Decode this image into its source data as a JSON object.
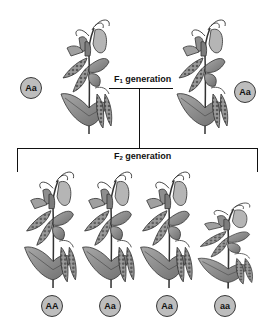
{
  "diagram": {
    "type": "mendelian-inheritance",
    "f1": {
      "label_prefix": "F",
      "label_sub": "1",
      "label_suffix": " generation",
      "plants": [
        {
          "genotype": "Aa",
          "phenotype": "tall"
        },
        {
          "genotype": "Aa",
          "phenotype": "tall"
        }
      ]
    },
    "f2": {
      "label_prefix": "F",
      "label_sub": "2",
      "label_suffix": " generation",
      "plants": [
        {
          "genotype": "AA",
          "phenotype": "tall"
        },
        {
          "genotype": "Aa",
          "phenotype": "tall"
        },
        {
          "genotype": "Aa",
          "phenotype": "tall"
        },
        {
          "genotype": "aa",
          "phenotype": "short"
        }
      ]
    },
    "colors": {
      "circle_fill": "#bdbdbd",
      "circle_stroke": "#3a3a3a",
      "leaf": "#8a8a8a",
      "pod": "#7a7a7a",
      "line": "#111111"
    }
  }
}
